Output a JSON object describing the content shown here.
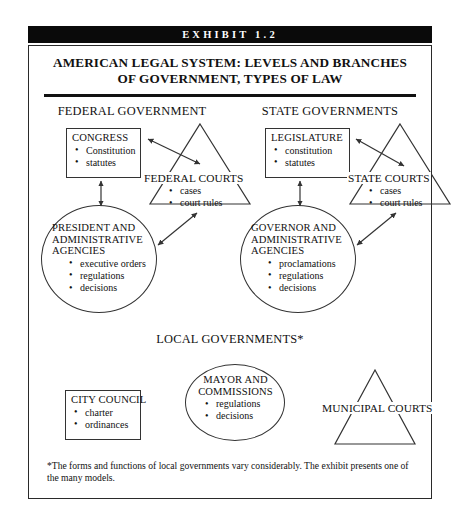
{
  "exhibit": {
    "bar_label": "EXHIBIT 1.2"
  },
  "title": {
    "line1": "AMERICAN LEGAL SYSTEM: LEVELS AND BRANCHES",
    "line2": "OF GOVERNMENT, TYPES OF LAW"
  },
  "sections": {
    "federal": "FEDERAL GOVERNMENT",
    "state": "STATE GOVERNMENTS",
    "local": "LOCAL GOVERNMENTS*"
  },
  "nodes": {
    "congress": {
      "title": "CONGRESS",
      "items": [
        "Constitution",
        "statutes"
      ]
    },
    "federal_courts": {
      "title": "FEDERAL COURTS",
      "items": [
        "cases",
        "court rules"
      ]
    },
    "president": {
      "title_lines": [
        "PRESIDENT AND",
        "ADMINISTRATIVE",
        "AGENCIES"
      ],
      "items": [
        "executive orders",
        "regulations",
        "decisions"
      ]
    },
    "legislature": {
      "title": "LEGISLATURE",
      "items": [
        "constitution",
        "statutes"
      ]
    },
    "state_courts": {
      "title": "STATE COURTS",
      "items": [
        "cases",
        "court rules"
      ]
    },
    "governor": {
      "title_lines": [
        "GOVERNOR AND",
        "ADMINISTRATIVE",
        "AGENCIES"
      ],
      "items": [
        "proclamations",
        "regulations",
        "decisions"
      ]
    },
    "city_council": {
      "title": "CITY COUNCIL",
      "items": [
        "charter",
        "ordinances"
      ]
    },
    "mayor": {
      "title_lines": [
        "MAYOR AND",
        "COMMISSIONS"
      ],
      "items": [
        "regulations",
        "decisions"
      ]
    },
    "municipal_courts": {
      "title": "MUNICIPAL COURTS"
    }
  },
  "footnote": {
    "text": "*The forms and functions of local governments vary considerably. The exhibit presents one of the many models."
  },
  "colors": {
    "ink": "#111111",
    "line": "#333333",
    "bar_bg": "#0a0a0a",
    "bar_fg": "#ffffff",
    "page_bg": "#ffffff"
  }
}
